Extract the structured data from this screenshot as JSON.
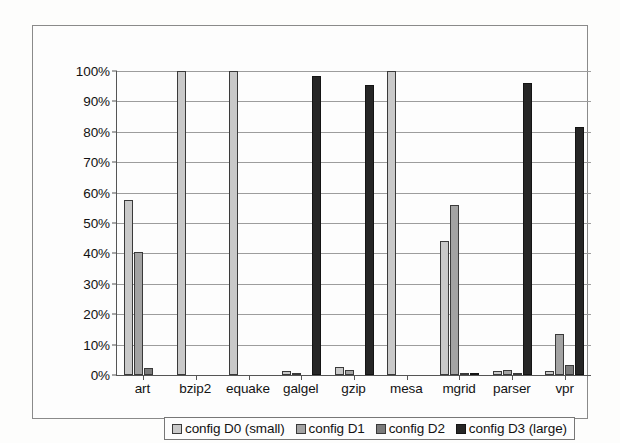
{
  "chart_data": {
    "type": "bar",
    "title": "",
    "subtitle": "",
    "xlabel": "",
    "ylabel": "",
    "ylim": [
      0,
      100
    ],
    "y_tick_labels": [
      "100%",
      "90%",
      "80%",
      "70%",
      "60%",
      "50%",
      "40%",
      "30%",
      "20%",
      "10%",
      "0%"
    ],
    "y_tick_values": [
      100,
      90,
      80,
      70,
      60,
      50,
      40,
      30,
      20,
      10,
      0
    ],
    "grid": "horizontal",
    "legend_position": "bottom",
    "categories": [
      "art",
      "bzip2",
      "equake",
      "galgel",
      "gzip",
      "mesa",
      "mgrid",
      "parser",
      "vpr"
    ],
    "series": [
      {
        "name": "config D0 (small)",
        "color": "#c9c9c9",
        "values": [
          57.5,
          100,
          100,
          1.2,
          2.5,
          100,
          44.0,
          1.3,
          1.2
        ]
      },
      {
        "name": "config D1",
        "color": "#a3a3a3",
        "values": [
          40.5,
          0,
          0,
          0.4,
          1.5,
          0,
          55.8,
          1.7,
          13.5
        ]
      },
      {
        "name": "config D2",
        "color": "#7b7b7b",
        "values": [
          2.4,
          0,
          0,
          0,
          0,
          0,
          0.4,
          0.7,
          3.3
        ]
      },
      {
        "name": "config D3 (large)",
        "color": "#262626",
        "values": [
          0,
          0,
          0,
          98.3,
          95.5,
          0,
          0.4,
          96.0,
          81.5
        ]
      }
    ]
  },
  "legend": {
    "entries": [
      {
        "label": "config D0 (small)"
      },
      {
        "label": "config D1"
      },
      {
        "label": "config D2"
      },
      {
        "label": "config D3 (large)"
      }
    ]
  }
}
